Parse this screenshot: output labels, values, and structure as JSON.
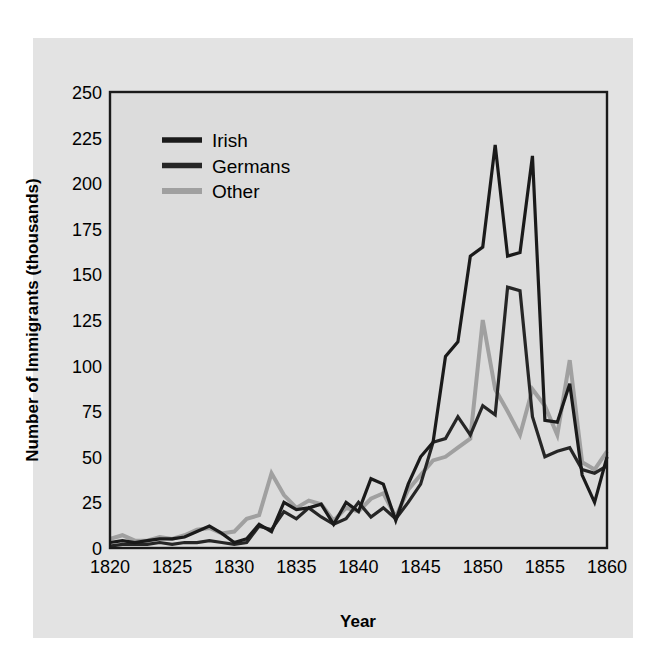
{
  "figure": {
    "background_color": "#e3e3e3",
    "page_color": "#ffffff",
    "plot_border_color": "#1a1a1a",
    "gridline_color": "#ffffff"
  },
  "axes": {
    "x_title": "Year",
    "y_title": "Number of Immigrants (thousands)",
    "x_ticks": [
      "1820",
      "1825",
      "1830",
      "1835",
      "1840",
      "1845",
      "1850",
      "1855",
      "1860"
    ],
    "y_ticks": [
      "0",
      "25",
      "50",
      "75",
      "100",
      "125",
      "150",
      "175",
      "200",
      "225",
      "250"
    ]
  },
  "legend": {
    "position": "upper-left-inside",
    "items": [
      {
        "label": "Irish",
        "color": "#1a1a1a"
      },
      {
        "label": "Germans",
        "color": "#262626"
      },
      {
        "label": "Other",
        "color": "#a0a0a0"
      }
    ]
  },
  "chart_data": {
    "type": "line",
    "title": "",
    "xlabel": "Year",
    "ylabel": "Number of Immigrants (thousands)",
    "xlim": [
      1820,
      1860
    ],
    "ylim": [
      0,
      250
    ],
    "xticks": [
      1820,
      1825,
      1830,
      1835,
      1840,
      1845,
      1850,
      1855,
      1860
    ],
    "yticks": [
      0,
      25,
      50,
      75,
      100,
      125,
      150,
      175,
      200,
      225,
      250
    ],
    "grid": true,
    "legend": [
      "Irish",
      "Germans",
      "Other"
    ],
    "x": [
      1820,
      1821,
      1822,
      1823,
      1824,
      1825,
      1826,
      1827,
      1828,
      1829,
      1830,
      1831,
      1832,
      1833,
      1834,
      1835,
      1836,
      1837,
      1838,
      1839,
      1840,
      1841,
      1842,
      1843,
      1844,
      1845,
      1846,
      1847,
      1848,
      1849,
      1850,
      1851,
      1852,
      1853,
      1854,
      1855,
      1856,
      1857,
      1858,
      1859,
      1860
    ],
    "series": [
      {
        "name": "Irish",
        "color": "#1a1a1a",
        "values": [
          3,
          4,
          3,
          4,
          5,
          5,
          6,
          9,
          12,
          8,
          3,
          5,
          13,
          9,
          25,
          21,
          22,
          24,
          13,
          25,
          20,
          38,
          35,
          15,
          35,
          50,
          58,
          105,
          113,
          160,
          165,
          221,
          160,
          162,
          215,
          70,
          69,
          90,
          40,
          25,
          50
        ],
        "linewidth": 3.2
      },
      {
        "name": "Germans",
        "color": "#262626",
        "values": [
          1,
          2,
          2,
          2,
          3,
          2,
          3,
          3,
          4,
          3,
          2,
          3,
          12,
          10,
          20,
          16,
          22,
          17,
          13,
          16,
          25,
          17,
          22,
          16,
          25,
          35,
          58,
          60,
          72,
          62,
          78,
          73,
          143,
          141,
          72,
          50,
          53,
          55,
          43,
          41,
          45
        ],
        "linewidth": 3.2
      },
      {
        "name": "Other",
        "color": "#a0a0a0",
        "values": [
          5,
          7,
          4,
          4,
          6,
          5,
          7,
          10,
          11,
          8,
          9,
          16,
          18,
          41,
          29,
          22,
          26,
          24,
          15,
          22,
          20,
          27,
          30,
          17,
          32,
          40,
          48,
          50,
          55,
          60,
          125,
          87,
          75,
          62,
          87,
          78,
          62,
          103,
          47,
          43,
          53
        ],
        "linewidth": 4.0
      }
    ]
  }
}
